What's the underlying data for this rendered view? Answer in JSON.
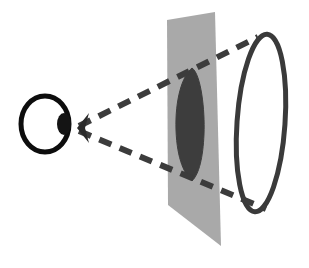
{
  "figure": {
    "width": 309,
    "height": 268,
    "background_color": "#ffffff"
  },
  "colors": {
    "eye_outline": "#0d0d0d",
    "pupil_fill": "#141414",
    "plane_fill": "#a9a9a9",
    "projection_fill": "#3d3d3d",
    "projection_stroke": "#3d3d3d",
    "circle_outline": "#3a3a3a",
    "ray_dash": "#3c3c3c",
    "apex_marker": "#2b2b2b"
  },
  "elements": {
    "eye": {
      "name": "eye",
      "center_x": 45,
      "center_y": 124,
      "radius_x": 24,
      "radius_y": 28,
      "stroke_width": 5
    },
    "pupil": {
      "name": "pupil",
      "center_x": 64,
      "center_y": 124,
      "radius_x": 7,
      "radius_y": 11
    },
    "apex": {
      "name": "view-apex",
      "x": 77,
      "y": 128
    },
    "image_plane": {
      "name": "image-plane",
      "points": "167,20 215,12 221,246 168,205",
      "opacity": 1
    },
    "projected_shape": {
      "name": "projected-ellipse",
      "path": "M192,68 C201,74 205,110 204,134 C203,158 199,174 192,181 C185,175 177,160 176,130 C175,100 182,76 192,68 Z"
    },
    "object_circle": {
      "name": "object-circle",
      "center_x": 261,
      "center_y": 123,
      "radius_x": 24,
      "radius_y": 89,
      "rotation_deg": 4,
      "stroke_width": 5
    },
    "rays": [
      {
        "name": "upper-sight-ray",
        "x1": 79,
        "y1": 126,
        "x2": 258,
        "y2": 37,
        "dash": "13 9",
        "stroke_width": 6
      },
      {
        "name": "lower-sight-ray",
        "x1": 79,
        "y1": 131,
        "x2": 266,
        "y2": 209,
        "dash": "13 9",
        "stroke_width": 6
      }
    ]
  },
  "labels": {
    "caption": ""
  }
}
